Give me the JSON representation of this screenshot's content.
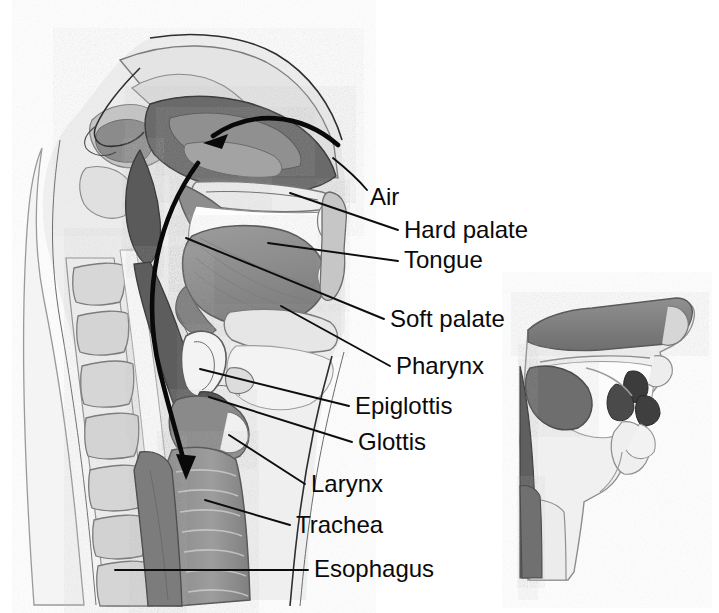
{
  "figure": {
    "background_color": "#ffffff",
    "text_color": "#0a0a0a",
    "leader_line_color": "#0d0d0d",
    "arrow_color": "#090909",
    "style": "grayscale halftone medical illustration"
  },
  "palette": {
    "bone_light": "#e9e9e9",
    "bone_mid": "#d8d8d8",
    "cartilage": "#f2f2f2",
    "mucosa_light": "#bdbdbd",
    "mucosa_mid": "#a2a2a2",
    "muscle_mid": "#8f8f8f",
    "muscle_dark": "#6f6f6f",
    "cavity_dark": "#5a5a5a",
    "cavity_darkest": "#4a4a4a",
    "tongue": "#909090",
    "outline": "#2e2e2e",
    "white": "#ffffff"
  },
  "labels": [
    {
      "id": "air",
      "text": "Air",
      "x": 370,
      "y": 205,
      "leader": {
        "type": "curve",
        "d": "M 367 190 C 357 178 348 170 333 158"
      }
    },
    {
      "id": "hard-palate",
      "text": "Hard palate",
      "x": 404,
      "y": 238,
      "leader": {
        "type": "line",
        "d": "M 398 230 L 290 193"
      }
    },
    {
      "id": "tongue",
      "text": "Tongue",
      "x": 404,
      "y": 268,
      "leader": {
        "type": "line",
        "d": "M 398 261 L 268 243"
      }
    },
    {
      "id": "soft-palate",
      "text": "Soft palate",
      "x": 390,
      "y": 327,
      "leader": {
        "type": "line",
        "d": "M 384 319 L 186 238"
      }
    },
    {
      "id": "pharynx",
      "text": "Pharynx",
      "x": 396,
      "y": 374,
      "leader": {
        "type": "line",
        "d": "M 390 366 L 281 306"
      }
    },
    {
      "id": "epiglottis",
      "text": "Epiglottis",
      "x": 355,
      "y": 414,
      "leader": {
        "type": "line",
        "d": "M 349 406 L 200 369"
      }
    },
    {
      "id": "glottis",
      "text": "Glottis",
      "x": 358,
      "y": 450,
      "leader": {
        "type": "line",
        "d": "M 352 442 L 209 397"
      }
    },
    {
      "id": "larynx",
      "text": "Larynx",
      "x": 311,
      "y": 492,
      "leader": {
        "type": "line",
        "d": "M 305 484 L 229 435"
      }
    },
    {
      "id": "trachea",
      "text": "Trachea",
      "x": 296,
      "y": 533,
      "leader": {
        "type": "line",
        "d": "M 290 525 L 205 500"
      }
    },
    {
      "id": "esophagus",
      "text": "Esophagus",
      "x": 314,
      "y": 577,
      "leader": {
        "type": "line",
        "d": "M 308 570 L 115 570"
      }
    }
  ],
  "airflow_arrows": [
    {
      "id": "nasal-inflow-arrow",
      "description": "Curved arrow entering the nasal cavity, pointing left",
      "path": "M 338 145 C 300 112 250 110 213 136",
      "arrowhead": {
        "x": 206,
        "y": 142,
        "angle": 145
      }
    },
    {
      "id": "pharynx-trachea-flow-arrow",
      "description": "Long curved arrow descending from the nasopharynx through the pharynx and larynx into the trachea",
      "path": "M 198 163 C 160 215 140 290 160 372 C 172 420 180 445 184 462",
      "arrowhead": {
        "x": 185,
        "y": 474,
        "angle": 76
      }
    }
  ],
  "inset": {
    "id": "inset-sagittal-view",
    "description": "Smaller simplified midsagittal view of the head and neck at lower right",
    "x": 520,
    "y": 290,
    "width": 199,
    "height": 290
  },
  "anatomy_regions": [
    {
      "name": "nasal-cavity",
      "tone": "cavity_dark"
    },
    {
      "name": "nasal-conchae",
      "tone": "mucosa_mid"
    },
    {
      "name": "hard-palate",
      "tone": "bone_light"
    },
    {
      "name": "soft-palate",
      "tone": "muscle_mid"
    },
    {
      "name": "tongue",
      "tone": "tongue"
    },
    {
      "name": "oral-cavity",
      "tone": "white"
    },
    {
      "name": "teeth",
      "tone": "cartilage"
    },
    {
      "name": "lips",
      "tone": "mucosa_light"
    },
    {
      "name": "pharynx",
      "tone": "cavity_dark"
    },
    {
      "name": "epiglottis",
      "tone": "cartilage"
    },
    {
      "name": "glottis",
      "tone": "cavity_darkest"
    },
    {
      "name": "larynx",
      "tone": "muscle_dark"
    },
    {
      "name": "trachea",
      "tone": "muscle_mid"
    },
    {
      "name": "esophagus",
      "tone": "muscle_dark"
    },
    {
      "name": "cervical-vertebrae",
      "tone": "bone_mid",
      "count": 7
    },
    {
      "name": "spinal-cord",
      "tone": "bone_light"
    },
    {
      "name": "frontal-sinus",
      "tone": "mucosa_mid"
    },
    {
      "name": "sphenoid-sinus",
      "tone": "mucosa_mid"
    },
    {
      "name": "mandible",
      "tone": "bone_light"
    },
    {
      "name": "hyoid",
      "tone": "cartilage"
    }
  ]
}
